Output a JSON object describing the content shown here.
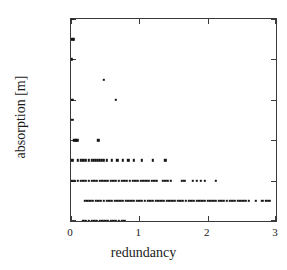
{
  "chart_data": {
    "type": "scatter",
    "title": "",
    "xlabel": "redundancy",
    "ylabel": "absorption [m]",
    "xlim": [
      0,
      3
    ],
    "ylim": [
      0.0,
      0.1
    ],
    "xticks": [
      "0",
      "1",
      "2",
      "3"
    ],
    "xtick_values": [
      0,
      1,
      2,
      3
    ],
    "yticks": [
      "0.00",
      "0.02",
      "0.04",
      "0.06",
      "0.08",
      "0.10"
    ],
    "ytick_values": [
      0.0,
      0.02,
      0.04,
      0.06,
      0.08,
      0.1
    ],
    "grid": false,
    "legend": null,
    "marker": "square",
    "marker_color": "#141414",
    "frame_color": "#3a3a3a",
    "background": "#ffffff",
    "series": [
      {
        "name": "absorption vs redundancy",
        "points": [
          [
            0.01,
            0.1
          ],
          [
            0.02,
            0.1
          ],
          [
            0.02,
            0.09
          ],
          [
            0.04,
            0.09
          ],
          [
            0.01,
            0.08
          ],
          [
            0.01,
            0.06
          ],
          [
            0.03,
            0.06
          ],
          [
            0.66,
            0.06
          ],
          [
            0.02,
            0.05
          ],
          [
            0.48,
            0.07
          ],
          [
            0.05,
            0.04
          ],
          [
            0.07,
            0.04
          ],
          [
            0.09,
            0.04
          ],
          [
            0.4,
            0.04
          ],
          [
            0.02,
            0.03
          ],
          [
            0.1,
            0.03
          ],
          [
            0.14,
            0.03
          ],
          [
            0.18,
            0.03
          ],
          [
            0.22,
            0.03
          ],
          [
            0.26,
            0.03
          ],
          [
            0.3,
            0.03
          ],
          [
            0.33,
            0.03
          ],
          [
            0.36,
            0.03
          ],
          [
            0.39,
            0.03
          ],
          [
            0.42,
            0.03
          ],
          [
            0.45,
            0.03
          ],
          [
            0.48,
            0.03
          ],
          [
            0.52,
            0.03
          ],
          [
            0.6,
            0.03
          ],
          [
            0.68,
            0.03
          ],
          [
            0.76,
            0.03
          ],
          [
            0.84,
            0.03
          ],
          [
            0.92,
            0.03
          ],
          [
            1.04,
            0.03
          ],
          [
            1.2,
            0.03
          ],
          [
            1.38,
            0.03
          ],
          [
            0.02,
            0.02
          ],
          [
            0.06,
            0.02
          ],
          [
            0.1,
            0.02
          ],
          [
            0.14,
            0.02
          ],
          [
            0.18,
            0.02
          ],
          [
            0.22,
            0.02
          ],
          [
            0.26,
            0.02
          ],
          [
            0.3,
            0.02
          ],
          [
            0.34,
            0.02
          ],
          [
            0.38,
            0.02
          ],
          [
            0.42,
            0.02
          ],
          [
            0.46,
            0.02
          ],
          [
            0.5,
            0.02
          ],
          [
            0.54,
            0.02
          ],
          [
            0.58,
            0.02
          ],
          [
            0.62,
            0.02
          ],
          [
            0.66,
            0.02
          ],
          [
            0.7,
            0.02
          ],
          [
            0.74,
            0.02
          ],
          [
            0.78,
            0.02
          ],
          [
            0.82,
            0.02
          ],
          [
            0.86,
            0.02
          ],
          [
            0.9,
            0.02
          ],
          [
            0.94,
            0.02
          ],
          [
            0.98,
            0.02
          ],
          [
            1.02,
            0.02
          ],
          [
            1.06,
            0.02
          ],
          [
            1.1,
            0.02
          ],
          [
            1.14,
            0.02
          ],
          [
            1.18,
            0.02
          ],
          [
            1.22,
            0.02
          ],
          [
            1.26,
            0.02
          ],
          [
            1.34,
            0.02
          ],
          [
            1.38,
            0.02
          ],
          [
            1.42,
            0.02
          ],
          [
            1.46,
            0.02
          ],
          [
            1.62,
            0.02
          ],
          [
            1.66,
            0.02
          ],
          [
            1.78,
            0.02
          ],
          [
            1.84,
            0.02
          ],
          [
            1.9,
            0.02
          ],
          [
            1.96,
            0.02
          ],
          [
            2.12,
            0.02
          ],
          [
            0.2,
            0.01
          ],
          [
            0.24,
            0.01
          ],
          [
            0.28,
            0.01
          ],
          [
            0.32,
            0.01
          ],
          [
            0.36,
            0.01
          ],
          [
            0.4,
            0.01
          ],
          [
            0.44,
            0.01
          ],
          [
            0.48,
            0.01
          ],
          [
            0.52,
            0.01
          ],
          [
            0.56,
            0.01
          ],
          [
            0.6,
            0.01
          ],
          [
            0.64,
            0.01
          ],
          [
            0.68,
            0.01
          ],
          [
            0.72,
            0.01
          ],
          [
            0.76,
            0.01
          ],
          [
            0.8,
            0.01
          ],
          [
            0.84,
            0.01
          ],
          [
            0.88,
            0.01
          ],
          [
            0.92,
            0.01
          ],
          [
            0.96,
            0.01
          ],
          [
            1.0,
            0.01
          ],
          [
            1.04,
            0.01
          ],
          [
            1.08,
            0.01
          ],
          [
            1.12,
            0.01
          ],
          [
            1.16,
            0.01
          ],
          [
            1.2,
            0.01
          ],
          [
            1.24,
            0.01
          ],
          [
            1.28,
            0.01
          ],
          [
            1.32,
            0.01
          ],
          [
            1.36,
            0.01
          ],
          [
            1.4,
            0.01
          ],
          [
            1.44,
            0.01
          ],
          [
            1.48,
            0.01
          ],
          [
            1.52,
            0.01
          ],
          [
            1.56,
            0.01
          ],
          [
            1.6,
            0.01
          ],
          [
            1.64,
            0.01
          ],
          [
            1.68,
            0.01
          ],
          [
            1.72,
            0.01
          ],
          [
            1.76,
            0.01
          ],
          [
            1.8,
            0.01
          ],
          [
            1.84,
            0.01
          ],
          [
            1.88,
            0.01
          ],
          [
            1.92,
            0.01
          ],
          [
            1.96,
            0.01
          ],
          [
            2.0,
            0.01
          ],
          [
            2.04,
            0.01
          ],
          [
            2.08,
            0.01
          ],
          [
            2.12,
            0.01
          ],
          [
            2.16,
            0.01
          ],
          [
            2.2,
            0.01
          ],
          [
            2.24,
            0.01
          ],
          [
            2.28,
            0.01
          ],
          [
            2.32,
            0.01
          ],
          [
            2.36,
            0.01
          ],
          [
            2.4,
            0.01
          ],
          [
            2.44,
            0.01
          ],
          [
            2.48,
            0.01
          ],
          [
            2.52,
            0.01
          ],
          [
            2.56,
            0.01
          ],
          [
            2.6,
            0.01
          ],
          [
            2.7,
            0.01
          ],
          [
            2.8,
            0.01
          ],
          [
            2.86,
            0.01
          ],
          [
            2.9,
            0.01
          ],
          [
            0.18,
            0.0
          ],
          [
            0.22,
            0.0
          ],
          [
            0.26,
            0.0
          ],
          [
            0.3,
            0.0
          ],
          [
            0.34,
            0.0
          ],
          [
            0.38,
            0.0
          ],
          [
            0.42,
            0.0
          ],
          [
            0.46,
            0.0
          ],
          [
            0.5,
            0.0
          ],
          [
            0.54,
            0.0
          ],
          [
            0.58,
            0.0
          ],
          [
            0.62,
            0.0
          ],
          [
            0.66,
            0.0
          ],
          [
            0.7,
            0.0
          ],
          [
            0.74,
            0.0
          ],
          [
            0.78,
            0.0
          ]
        ]
      }
    ]
  }
}
